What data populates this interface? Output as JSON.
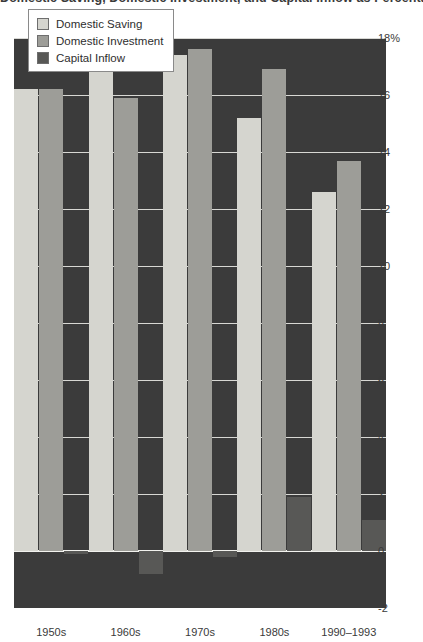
{
  "chart_data": {
    "type": "bar",
    "title": "Domestic Saving, Domestic Investment, and Capital Inflow as Percentages of GDP, 1950–1993",
    "xlabel": "",
    "ylabel": "",
    "ylim": [
      -2,
      18
    ],
    "ytick_values": [
      18,
      16,
      14,
      12,
      10,
      8,
      6,
      4,
      2,
      0,
      -2
    ],
    "ytick_labels": [
      "18%",
      "16",
      "14",
      "12",
      "10",
      "8",
      "6",
      "4",
      "2",
      "0",
      "-2"
    ],
    "grid": true,
    "legend_position": "top-left",
    "categories": [
      "1950s",
      "1960s",
      "1970s",
      "1980s",
      "1990–1993"
    ],
    "series": [
      {
        "name": "Domestic Saving",
        "color": "#d5d5cf",
        "values": [
          16.2,
          16.8,
          17.4,
          15.2,
          12.6
        ]
      },
      {
        "name": "Domestic Investment",
        "color": "#9d9d98",
        "values": [
          16.2,
          15.9,
          17.6,
          16.9,
          13.7
        ]
      },
      {
        "name": "Capital Inflow",
        "color": "#585856",
        "values": [
          -0.1,
          -0.8,
          -0.2,
          1.9,
          1.1
        ]
      }
    ]
  },
  "legend": {
    "items": [
      {
        "label": "Domestic Saving"
      },
      {
        "label": "Domestic Investment"
      },
      {
        "label": "Capital Inflow"
      }
    ]
  }
}
